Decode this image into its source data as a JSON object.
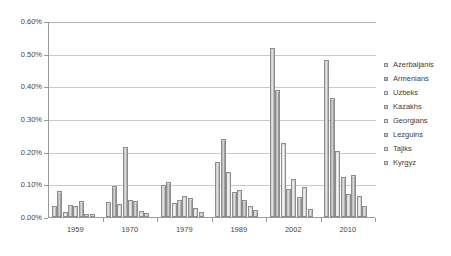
{
  "chart_data": {
    "type": "bar",
    "title": "",
    "subtitle": "",
    "xlabel": "",
    "ylabel": "",
    "categories": [
      "1959",
      "1970",
      "1979",
      "1989",
      "2002",
      "2010"
    ],
    "ylim": [
      0,
      0.6
    ],
    "ytick_values": [
      0.0,
      0.1,
      0.2,
      0.3,
      0.4,
      0.5,
      0.6
    ],
    "ytick_labels": [
      "0.00%",
      "0.10%",
      "0.20%",
      "0.30%",
      "0.40%",
      "0.50%",
      "0.60%"
    ],
    "grid": true,
    "legend_position": "right",
    "value_unit": "percent",
    "series": [
      {
        "name": "Azerbaijanis",
        "values": [
          0.032,
          0.044,
          0.095,
          0.165,
          0.513,
          0.477
        ]
      },
      {
        "name": "Armenians",
        "values": [
          0.077,
          0.091,
          0.103,
          0.235,
          0.385,
          0.362
        ]
      },
      {
        "name": "Uzbeks",
        "values": [
          0.011,
          0.038,
          0.04,
          0.134,
          0.224,
          0.2
        ]
      },
      {
        "name": "Kazakhs",
        "values": [
          0.034,
          0.212,
          0.048,
          0.074,
          0.082,
          0.12
        ]
      },
      {
        "name": "Georgians",
        "values": [
          0.031,
          0.05,
          0.062,
          0.081,
          0.114,
          0.068
        ]
      },
      {
        "name": "Lezguins",
        "values": [
          0.045,
          0.045,
          0.055,
          0.05,
          0.059,
          0.127
        ]
      },
      {
        "name": "Tajiks",
        "values": [
          0.003,
          0.015,
          0.024,
          0.031,
          0.09,
          0.06
        ]
      },
      {
        "name": "Kyrgyz",
        "values": [
          0.002,
          0.01,
          0.012,
          0.019,
          0.023,
          0.031
        ]
      }
    ]
  },
  "legend": {
    "items": [
      {
        "label": "Azerbaijanis"
      },
      {
        "label": "Armenians"
      },
      {
        "label": "Uzbeks"
      },
      {
        "label": "Kazakhs"
      },
      {
        "label": "Georgians"
      },
      {
        "label": "Lezguins"
      },
      {
        "label": "Tajiks"
      },
      {
        "label": "Kyrgyz"
      }
    ]
  },
  "colors": {
    "axis": "#9a9a9a",
    "grid": "#c9c9c9",
    "text": "#464646",
    "background": "#ffffff"
  }
}
